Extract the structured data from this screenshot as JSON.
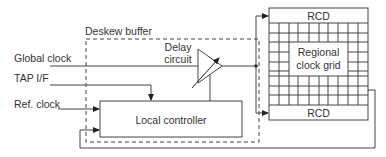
{
  "diagram": {
    "deskew_buffer": {
      "label": "Deskew buffer"
    },
    "inputs": {
      "global_clock": "Global clock",
      "tap_if": "TAP I/F",
      "ref_clock": "Ref. clock"
    },
    "delay_circuit": {
      "label_line1": "Delay",
      "label_line2": "circuit"
    },
    "local_controller": {
      "label": "Local controller"
    },
    "regional_grid": {
      "label_line1": "Regional",
      "label_line2": "clock grid",
      "top_rcd": "RCD",
      "bottom_rcd": "RCD"
    },
    "colors": {
      "stroke": "#444444",
      "text": "#333333",
      "background": "#ffffff"
    }
  }
}
